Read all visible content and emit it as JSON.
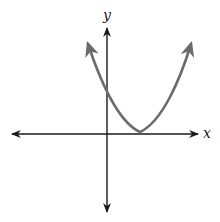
{
  "figure": {
    "type": "coordinate-graph",
    "axes": {
      "x_label": "x",
      "y_label": "y",
      "origin_px": [
        107,
        134
      ],
      "x_extent_px": [
        12,
        198
      ],
      "y_extent_px": [
        28,
        212
      ],
      "color": "#1a1a1a"
    },
    "curve": {
      "kind": "parabola",
      "opens": "up",
      "vertex_px": [
        140,
        132
      ],
      "y_intercept_px": [
        107,
        95
      ],
      "left_arrow_tip_px": [
        88,
        42
      ],
      "right_arrow_tip_px": [
        191,
        42
      ],
      "color": "#6b6b6b"
    }
  }
}
